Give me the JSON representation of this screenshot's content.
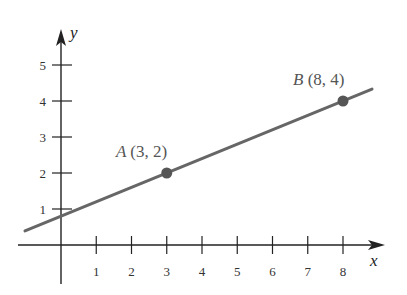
{
  "chart_data": {
    "type": "line",
    "title": "",
    "xlabel": "x",
    "ylabel": "y",
    "xlim": [
      -1.2,
      9.2
    ],
    "ylim": [
      -0.7,
      6
    ],
    "x_ticks": [
      1,
      2,
      3,
      4,
      5,
      6,
      7,
      8
    ],
    "y_ticks": [
      1,
      2,
      3,
      4,
      5
    ],
    "grid": false,
    "series": [
      {
        "name": "line through A and B",
        "slope": 0.4,
        "intercept": 0.8,
        "x": [
          -1,
          9
        ],
        "y": [
          0.4,
          4.4
        ],
        "color": "#666666"
      }
    ],
    "points": [
      {
        "name": "A",
        "x": 3,
        "y": 2,
        "label": "(3, 2)"
      },
      {
        "name": "B",
        "x": 8,
        "y": 4,
        "label": "(8, 4)"
      }
    ],
    "point_color": "#555555",
    "axis_color": "#222222"
  }
}
